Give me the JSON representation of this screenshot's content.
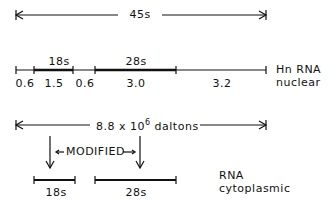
{
  "diagram": {
    "top_span": {
      "label": "45s"
    },
    "nuclear": {
      "species_label": "Hn RNA",
      "location_label": "nuclear",
      "segments": [
        {
          "value": "0.6",
          "name": ""
        },
        {
          "value": "1.5",
          "name": "18s"
        },
        {
          "value": "0.6",
          "name": ""
        },
        {
          "value": "3.0",
          "name": "28s"
        },
        {
          "value": "3.2",
          "name": ""
        }
      ]
    },
    "mass_span": {
      "label_prefix": "8.8 x 10",
      "label_exp": "6",
      "label_suffix": " daltons"
    },
    "modified_label": "MODIFIED",
    "cytoplasmic": {
      "species_label": "RNA",
      "location_label": "cytoplasmic",
      "products": [
        {
          "name": "18s"
        },
        {
          "name": "28s"
        }
      ]
    },
    "colors": {
      "ink": "#111111",
      "background": "#ffffff"
    }
  }
}
